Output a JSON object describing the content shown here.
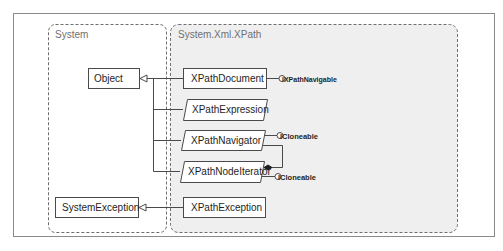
{
  "diagram": {
    "type": "uml-class-diagram",
    "colors": {
      "frame": "#8a8a8a",
      "package_border": "#6e6e6e",
      "package_fill_xpath": "#efefef",
      "box_border": "#4a4a4a",
      "box_fill": "#ffffff",
      "text": "#1e1e1e",
      "package_label": "#707070"
    },
    "packages": [
      {
        "id": "system",
        "label": "System"
      },
      {
        "id": "xpath",
        "label": "System.Xml.XPath"
      }
    ],
    "classes": [
      {
        "id": "object",
        "label": "Object",
        "package": "system",
        "abstract": false
      },
      {
        "id": "system-exception",
        "label": "SystemException",
        "package": "system",
        "abstract": false
      },
      {
        "id": "xpath-document",
        "label": "XPathDocument",
        "package": "xpath",
        "abstract": false
      },
      {
        "id": "xpath-expression",
        "label": "XPathExpression",
        "package": "xpath",
        "abstract": true
      },
      {
        "id": "xpath-navigator",
        "label": "XPathNavigator",
        "package": "xpath",
        "abstract": true
      },
      {
        "id": "xpath-node-iterator",
        "label": "XPathNodeIterator",
        "package": "xpath",
        "abstract": true
      },
      {
        "id": "xpath-exception",
        "label": "XPathException",
        "package": "xpath",
        "abstract": false
      }
    ],
    "interfaces": [
      {
        "id": "ixpathnavigable",
        "label": "IXPathNavigable",
        "owner": "xpath-document"
      },
      {
        "id": "icloneable-nav",
        "label": "ICloneable",
        "owner": "xpath-navigator"
      },
      {
        "id": "icloneable-iter",
        "label": "ICloneable",
        "owner": "xpath-node-iterator"
      }
    ],
    "relations": [
      {
        "from": "xpath-document",
        "to": "object",
        "type": "inheritance"
      },
      {
        "from": "xpath-expression",
        "to": "object",
        "type": "inheritance"
      },
      {
        "from": "xpath-navigator",
        "to": "object",
        "type": "inheritance"
      },
      {
        "from": "xpath-node-iterator",
        "to": "object",
        "type": "inheritance"
      },
      {
        "from": "xpath-exception",
        "to": "system-exception",
        "type": "inheritance"
      },
      {
        "from": "xpath-node-iterator",
        "to": "xpath-navigator",
        "type": "composition"
      }
    ]
  }
}
